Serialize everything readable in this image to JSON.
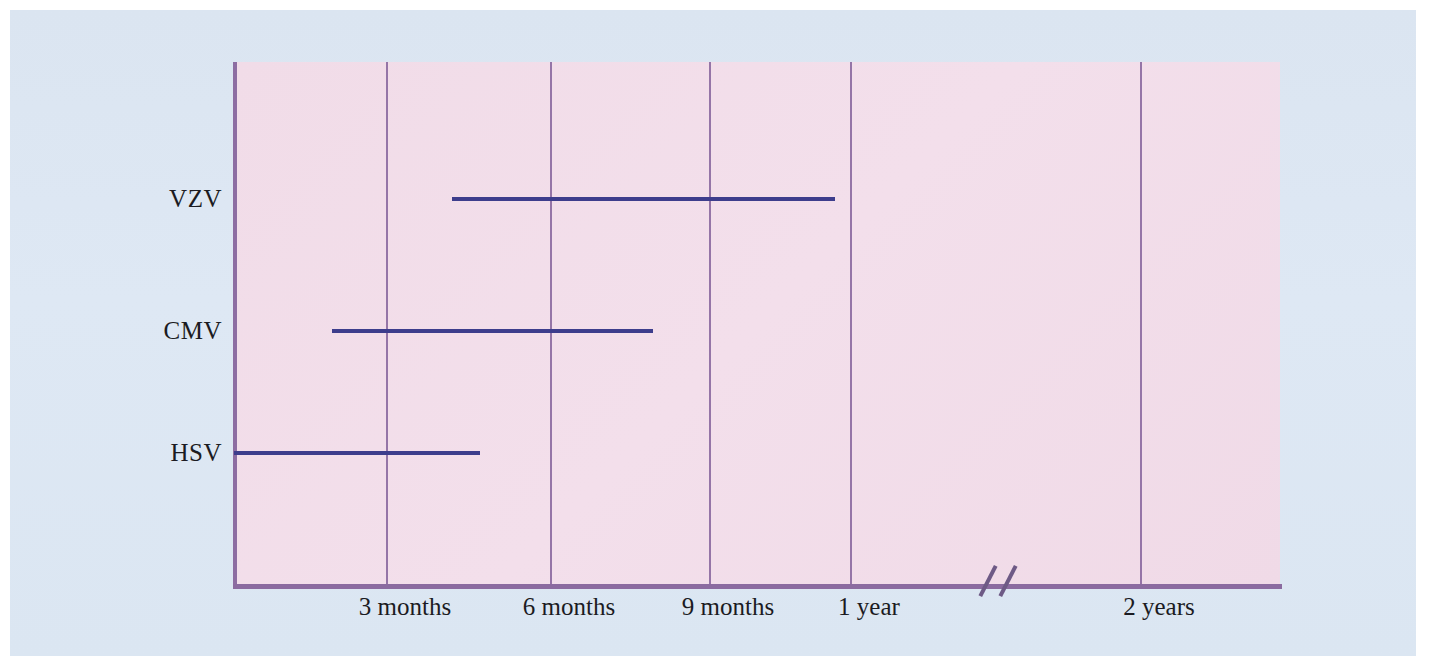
{
  "figure": {
    "title": "",
    "background_color": "#dce7f3",
    "plot_background_color": "#f1dce9",
    "grid_color": "#8f6fa3",
    "axis_color": "#8b6ba0",
    "bar_color": "#3d3d8c",
    "text_color": "#1b1b22"
  },
  "axis_break": {
    "name": "axis-break",
    "symbol": "//",
    "x_px": 1002
  },
  "chart_data": {
    "type": "bar",
    "orientation": "horizontal",
    "subtype": "timeline-range",
    "title": "",
    "xlabel": "",
    "ylabel": "",
    "grid": true,
    "legend": null,
    "x_tick_labels": [
      "3 months",
      "6 months",
      "9 months",
      "1 year",
      "2 years"
    ],
    "x_tick_values_months": [
      3,
      6,
      9,
      12,
      24
    ],
    "x_tick_px": [
      386,
      550,
      709,
      850,
      1140
    ],
    "axis_break_between": [
      "1 year",
      "2 years"
    ],
    "categories": [
      "VZV",
      "CMV",
      "HSV"
    ],
    "series": [
      {
        "name": "Risk period",
        "ranges": [
          {
            "category": "VZV",
            "start_months": 4.0,
            "end_months": 11.0,
            "start_px": 452,
            "end_px": 835,
            "y_px": 199
          },
          {
            "category": "CMV",
            "start_months": 1.8,
            "end_months": 7.9,
            "start_px": 332,
            "end_px": 653,
            "y_px": 331
          },
          {
            "category": "HSV",
            "start_months": 0.0,
            "end_months": 4.5,
            "start_px": 234,
            "end_px": 480,
            "y_px": 453
          }
        ]
      }
    ]
  }
}
